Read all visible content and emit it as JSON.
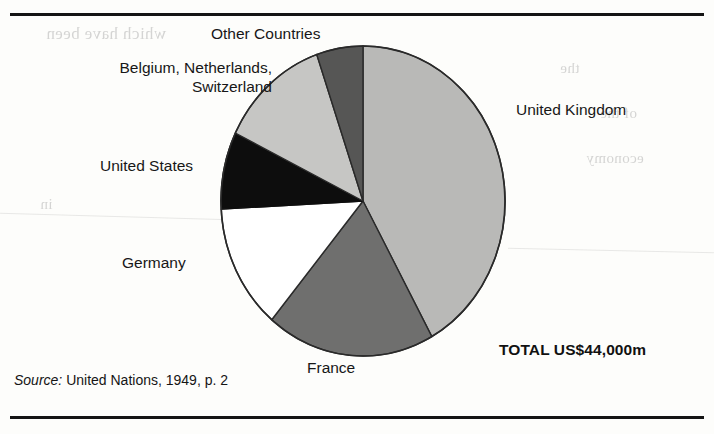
{
  "figure": {
    "total_label": "TOTAL US$44,000m",
    "source": {
      "prefix": "Source:",
      "text": " United Nations, 1949, p. 2"
    }
  },
  "chart_data": {
    "type": "pie",
    "title": "",
    "subtitle": "",
    "xlabel": "",
    "ylabel": "",
    "units": "US$ million",
    "total": 44000,
    "total_label": "TOTAL US$44,000m",
    "legend_position": "callout-labels",
    "grid": false,
    "start_angle_deg": 0,
    "direction": "clockwise",
    "labels": [
      "United Kingdom",
      "France",
      "Germany",
      "United States",
      "Belgium, Netherlands, Switzerland",
      "Other Countries"
    ],
    "values": [
      42,
      19,
      13,
      8,
      13,
      5
    ],
    "slices": [
      {
        "name": "United Kingdom",
        "label": "United Kingdom",
        "percent": 42,
        "value_usd_m": 18480,
        "start_deg": 0,
        "end_deg": 151,
        "color": "#b9b9b7",
        "stroke": "#2a2a2a"
      },
      {
        "name": "France",
        "label": "France",
        "percent": 19,
        "value_usd_m": 8360,
        "start_deg": 151,
        "end_deg": 220,
        "color": "#6f6f6e",
        "stroke": "#2a2a2a"
      },
      {
        "name": "Germany",
        "label": "Germany",
        "percent": 13,
        "value_usd_m": 5720,
        "start_deg": 220,
        "end_deg": 267,
        "color": "#ffffff",
        "stroke": "#2a2a2a"
      },
      {
        "name": "United States",
        "label": "United States",
        "percent": 8,
        "value_usd_m": 3520,
        "start_deg": 267,
        "end_deg": 296,
        "color": "#0d0d0d",
        "stroke": "#0d0d0d"
      },
      {
        "name": "Belgium, Netherlands, Switzerland",
        "label": "Belgium, Netherlands,\nSwitzerland",
        "percent": 13,
        "value_usd_m": 5720,
        "start_deg": 296,
        "end_deg": 341,
        "color": "#c6c6c4",
        "stroke": "#2a2a2a"
      },
      {
        "name": "Other Countries",
        "label": "Other Countries",
        "percent": 5,
        "value_usd_m": 2200,
        "start_deg": 341,
        "end_deg": 360,
        "color": "#565655",
        "stroke": "#2a2a2a"
      }
    ],
    "geometry": {
      "cx": 363,
      "cy": 201,
      "rx": 142,
      "ry": 155
    }
  },
  "callouts": {
    "uk": "United Kingdom",
    "other_countries": "Other Countries",
    "benelux_line1": "Belgium, Netherlands,",
    "benelux_line2": "Switzerland",
    "united_states": "United States",
    "germany": "Germany",
    "france": "France"
  },
  "page_bleed": {
    "line1": "which have been",
    "line2": "the",
    "line3": "of the",
    "line4": "economy",
    "line5": "in"
  }
}
